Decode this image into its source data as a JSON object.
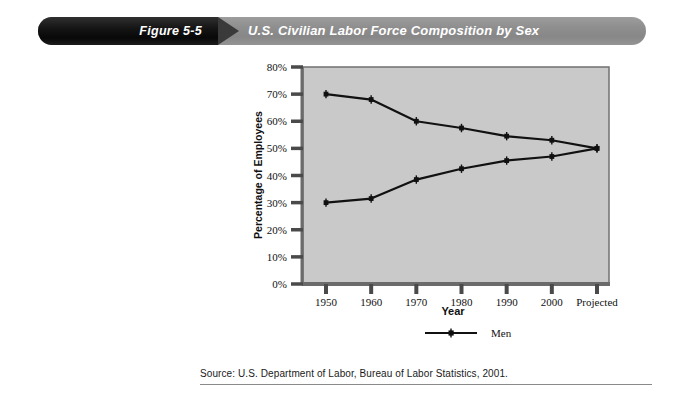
{
  "banner": {
    "figure_number": "Figure 5-5",
    "title": "U.S. Civilian Labor Force Composition by Sex",
    "left_bg_color": "#0d0d0d",
    "right_bg_color": "#8f8f8f",
    "arrow_color": "#3a3a3a",
    "text_color": "#ffffff"
  },
  "source": {
    "text": "Source: U.S. Department of Labor, Bureau of Labor Statistics, 2001."
  },
  "chart_data": {
    "type": "line",
    "title": "U.S. Civilian Labor Force Composition by Sex",
    "xlabel": "Year",
    "ylabel": "Percentage of Employees",
    "categories": [
      "1950",
      "1960",
      "1970",
      "1980",
      "1990",
      "2000",
      "Projected"
    ],
    "series": [
      {
        "name": "Men",
        "values": [
          70,
          68,
          60,
          57.5,
          54.5,
          53,
          50
        ]
      },
      {
        "name": "Women",
        "values": [
          30,
          31.5,
          38.5,
          42.5,
          45.5,
          47,
          50
        ]
      }
    ],
    "ylim": [
      0,
      80
    ],
    "ytick_step": 10,
    "ytick_labels": [
      "0%",
      "10%",
      "20%",
      "30%",
      "40%",
      "50%",
      "60%",
      "70%",
      "80%"
    ],
    "grid": false,
    "legend_position": "bottom",
    "plot_bg_color": "#c9c9c9",
    "line_color": "#111111",
    "axis_color": "#5a5a5a"
  }
}
